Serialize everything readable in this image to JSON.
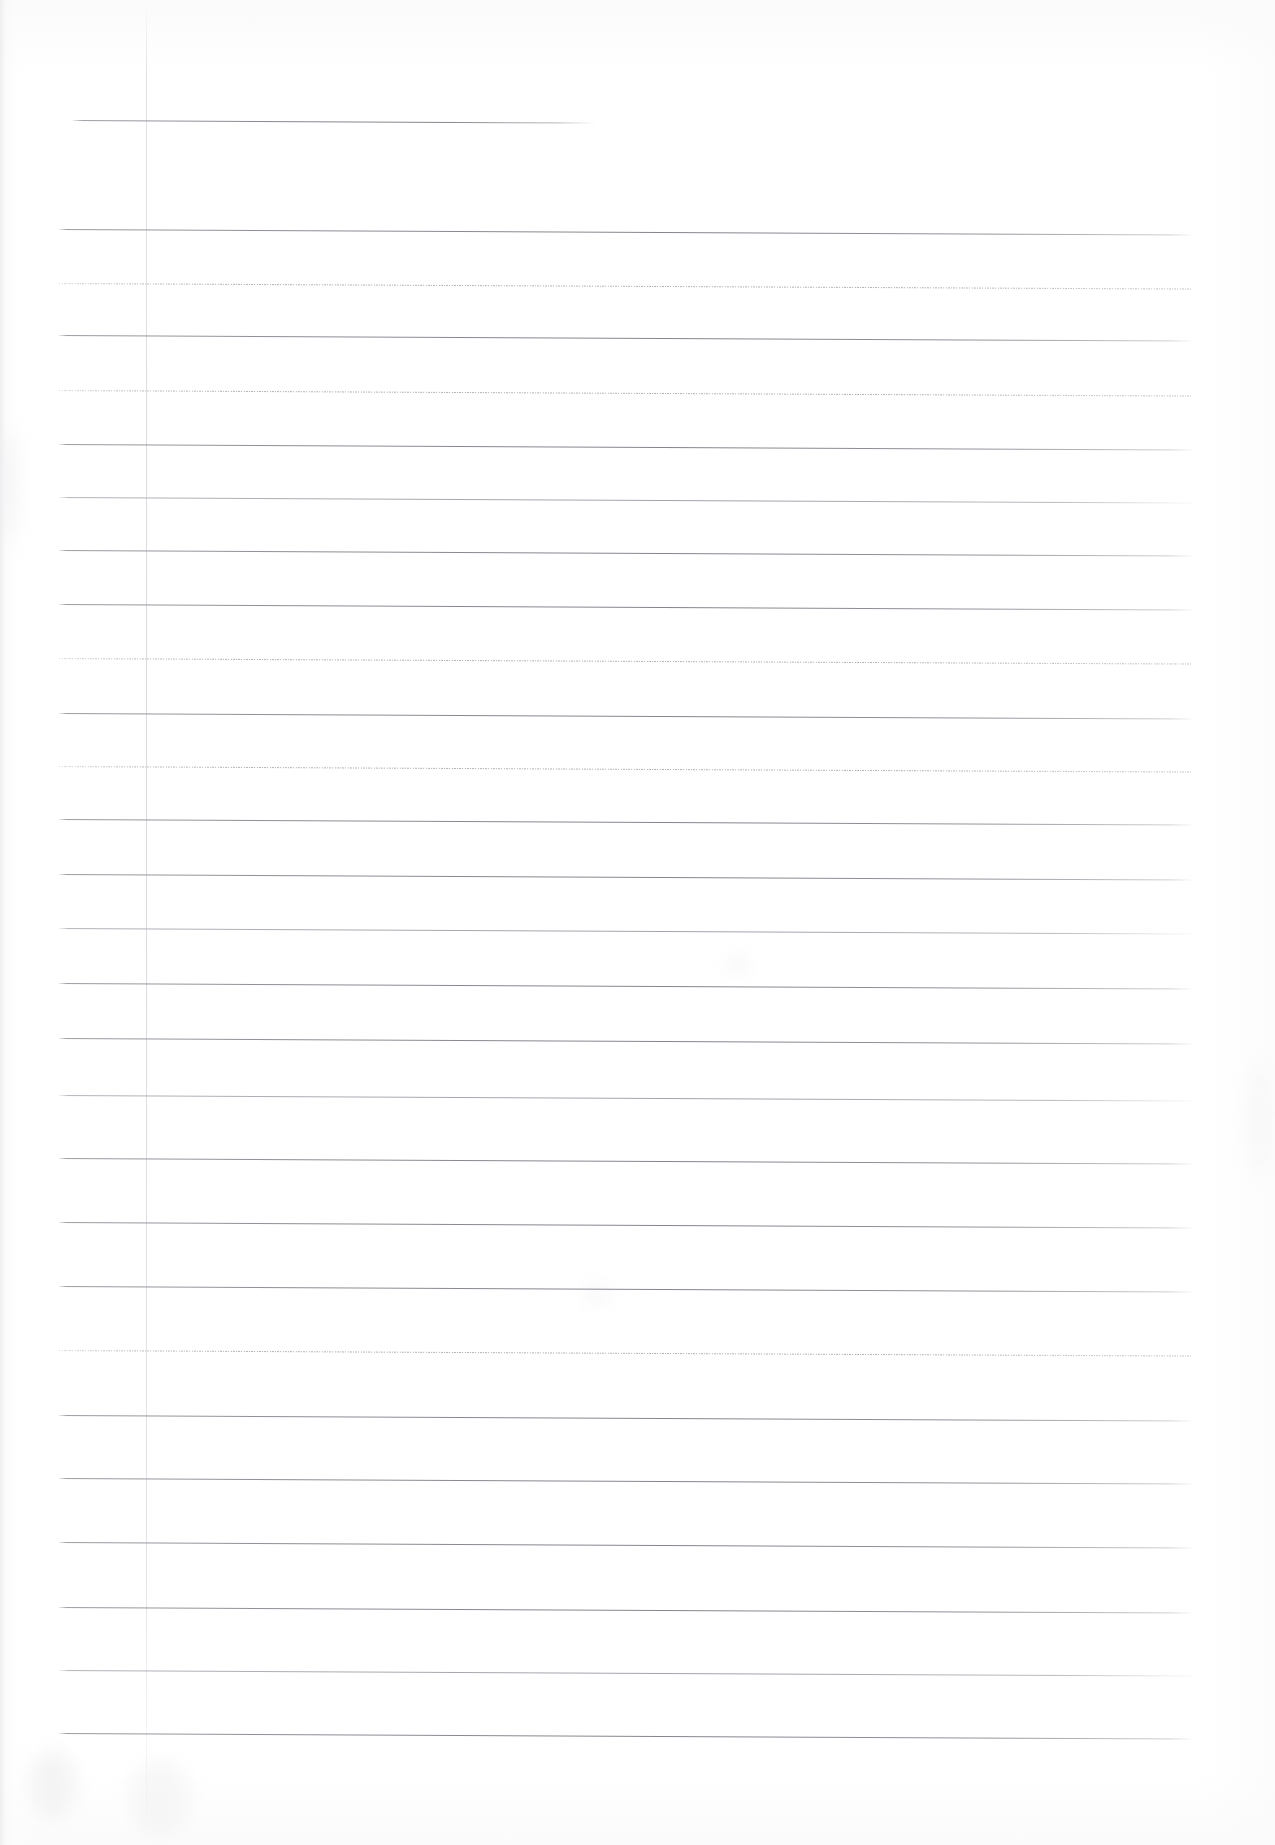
{
  "document": {
    "kind": "scanned-ruled-notebook-page",
    "title": "Blank Ruled Page",
    "page_width": 1275,
    "page_height": 1845,
    "background_color": "#ffffff",
    "paper_tone": "#fdfdfd",
    "rule_color": "#8b8b94",
    "faint_rule_color": "#a8a8b1",
    "margin_rule_color": "#d4d4da",
    "text_content": "",
    "visible_text_blocks": []
  },
  "layout": {
    "content_left": 72,
    "content_right": 1193,
    "margin_rule_x": 146,
    "first_rule_y": 120,
    "rule_spacing": 63.7,
    "rule_skew_deg": 0.28
  },
  "rules": [
    {
      "index": 0,
      "y": 120,
      "x1": 73,
      "x2": 597,
      "weight": "stub",
      "note": "truncated top rule"
    },
    {
      "index": 1,
      "y": 229,
      "x1": 59,
      "x2": 1192,
      "weight": "solid",
      "note": ""
    },
    {
      "index": 2,
      "y": 283,
      "x1": 59,
      "x2": 1192,
      "weight": "faint",
      "note": ""
    },
    {
      "index": 3,
      "y": 335,
      "x1": 59,
      "x2": 1192,
      "weight": "solid",
      "note": ""
    },
    {
      "index": 4,
      "y": 390,
      "x1": 59,
      "x2": 1192,
      "weight": "faint",
      "note": ""
    },
    {
      "index": 5,
      "y": 444,
      "x1": 59,
      "x2": 1192,
      "weight": "solid",
      "note": ""
    },
    {
      "index": 6,
      "y": 497,
      "x1": 59,
      "x2": 1192,
      "weight": "light",
      "note": ""
    },
    {
      "index": 7,
      "y": 550,
      "x1": 59,
      "x2": 1192,
      "weight": "solid",
      "note": ""
    },
    {
      "index": 8,
      "y": 604,
      "x1": 59,
      "x2": 1192,
      "weight": "solid",
      "note": ""
    },
    {
      "index": 9,
      "y": 658,
      "x1": 59,
      "x2": 1192,
      "weight": "faint",
      "note": ""
    },
    {
      "index": 10,
      "y": 713,
      "x1": 59,
      "x2": 1192,
      "weight": "solid",
      "note": ""
    },
    {
      "index": 11,
      "y": 766,
      "x1": 59,
      "x2": 1192,
      "weight": "faint",
      "note": ""
    },
    {
      "index": 12,
      "y": 819,
      "x1": 59,
      "x2": 1192,
      "weight": "solid",
      "note": ""
    },
    {
      "index": 13,
      "y": 874,
      "x1": 59,
      "x2": 1192,
      "weight": "solid",
      "note": ""
    },
    {
      "index": 14,
      "y": 928,
      "x1": 59,
      "x2": 1192,
      "weight": "light",
      "note": ""
    },
    {
      "index": 15,
      "y": 983,
      "x1": 59,
      "x2": 1192,
      "weight": "solid",
      "note": ""
    },
    {
      "index": 16,
      "y": 1038,
      "x1": 59,
      "x2": 1192,
      "weight": "solid",
      "note": ""
    },
    {
      "index": 17,
      "y": 1095,
      "x1": 59,
      "x2": 1192,
      "weight": "light",
      "note": ""
    },
    {
      "index": 18,
      "y": 1158,
      "x1": 59,
      "x2": 1192,
      "weight": "solid",
      "note": ""
    },
    {
      "index": 19,
      "y": 1222,
      "x1": 59,
      "x2": 1192,
      "weight": "solid",
      "note": ""
    },
    {
      "index": 20,
      "y": 1286,
      "x1": 59,
      "x2": 1192,
      "weight": "solid",
      "note": ""
    },
    {
      "index": 21,
      "y": 1350,
      "x1": 59,
      "x2": 1192,
      "weight": "faint",
      "note": ""
    },
    {
      "index": 22,
      "y": 1415,
      "x1": 59,
      "x2": 1192,
      "weight": "solid",
      "note": ""
    },
    {
      "index": 23,
      "y": 1478,
      "x1": 59,
      "x2": 1192,
      "weight": "solid",
      "note": ""
    },
    {
      "index": 24,
      "y": 1542,
      "x1": 59,
      "x2": 1192,
      "weight": "solid",
      "note": ""
    },
    {
      "index": 25,
      "y": 1607,
      "x1": 59,
      "x2": 1192,
      "weight": "solid",
      "note": ""
    },
    {
      "index": 26,
      "y": 1670,
      "x1": 59,
      "x2": 1192,
      "weight": "light",
      "note": ""
    },
    {
      "index": 27,
      "y": 1733,
      "x1": 59,
      "x2": 1192,
      "weight": "solid",
      "note": ""
    }
  ],
  "blotches": [
    {
      "x": 30,
      "y": 1750,
      "w": 46,
      "h": 70,
      "color": "#f0f0f2",
      "opacity": 0.7
    },
    {
      "x": 130,
      "y": 1760,
      "w": 60,
      "h": 80,
      "color": "#f2f2f4",
      "opacity": 0.6
    },
    {
      "x": 726,
      "y": 960,
      "w": 22,
      "h": 10,
      "color": "#ececef",
      "opacity": 0.8
    },
    {
      "x": 584,
      "y": 1288,
      "w": 26,
      "h": 12,
      "color": "#eeeef1",
      "opacity": 0.7
    },
    {
      "x": 0,
      "y": 430,
      "w": 16,
      "h": 110,
      "color": "#ededf0",
      "opacity": 0.55
    },
    {
      "x": 1246,
      "y": 1060,
      "w": 30,
      "h": 120,
      "color": "#f4f4f6",
      "opacity": 0.5
    }
  ]
}
